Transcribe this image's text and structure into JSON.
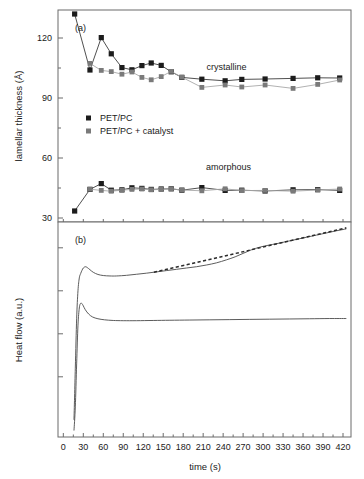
{
  "figure": {
    "background": "#ffffff",
    "panel_a_label": "(a)",
    "panel_b_label": "(b)"
  },
  "chart_data": [
    {
      "type": "scatter",
      "panel": "(a)",
      "title": "",
      "xlabel": "",
      "ylabel": "lamellar thickness (Å)",
      "xlim": [
        -8,
        432
      ],
      "ylim": [
        28,
        134
      ],
      "xticks": [
        0,
        30,
        60,
        90,
        120,
        150,
        180,
        210,
        240,
        270,
        300,
        330,
        360,
        390,
        420
      ],
      "yticks": [
        30,
        60,
        90,
        120
      ],
      "ytick_labels": [
        "30",
        "60",
        "90",
        "120"
      ],
      "minor_yticks": [
        45,
        75,
        105
      ],
      "grid": false,
      "legend_position": "center-left",
      "legend": [
        {
          "label": "PET/PC",
          "marker": "filled-square-dark",
          "color": "#1c1c1c"
        },
        {
          "label": "PET/PC + catalyst",
          "marker": "filled-square-gray",
          "color": "#7a7a7a"
        }
      ],
      "annotations": [
        {
          "text": "crystalline",
          "x": 245,
          "y": 104
        },
        {
          "text": "amorphous",
          "x": 248,
          "y": 54
        }
      ],
      "series": [
        {
          "name": "PET/PC crystalline",
          "color": "#1c1c1c",
          "marker": "square",
          "x": [
            17,
            40,
            57,
            72,
            88,
            103,
            118,
            132,
            147,
            162,
            178,
            208,
            243,
            268,
            303,
            345,
            382,
            415
          ],
          "y": [
            132,
            104,
            120.2,
            112.1,
            105.2,
            104.1,
            106.2,
            107.5,
            106.3,
            103.1,
            100.3,
            99.4,
            98.6,
            99.3,
            99.5,
            99.8,
            100.1,
            100.0
          ]
        },
        {
          "name": "PET/PC + catalyst crystalline",
          "color": "#7a7a7a",
          "marker": "square",
          "x": [
            40,
            57,
            72,
            88,
            103,
            118,
            132,
            147,
            162,
            178,
            208,
            243,
            268,
            303,
            345,
            382,
            415
          ],
          "y": [
            107.3,
            103.8,
            103.2,
            101.9,
            103.0,
            100.3,
            99.1,
            100.7,
            103.3,
            100.4,
            95.3,
            96.5,
            95.5,
            96.5,
            94.8,
            96.8,
            99.0
          ]
        },
        {
          "name": "PET/PC amorphous",
          "color": "#1c1c1c",
          "marker": "square",
          "x": [
            17,
            40,
            57,
            72,
            88,
            103,
            118,
            132,
            147,
            162,
            178,
            208,
            243,
            268,
            303,
            345,
            382,
            415
          ],
          "y": [
            33.5,
            44.3,
            47.2,
            43.9,
            44.1,
            45.1,
            44.8,
            44.3,
            44.5,
            44.6,
            43.9,
            45.2,
            43.8,
            43.9,
            43.5,
            44.1,
            44.2,
            43.8
          ]
        },
        {
          "name": "PET/PC + catalyst amorphous",
          "color": "#7a7a7a",
          "marker": "square",
          "x": [
            40,
            57,
            72,
            88,
            103,
            118,
            132,
            147,
            162,
            178,
            208,
            243,
            268,
            303,
            345,
            382,
            415
          ],
          "y": [
            44.4,
            43.8,
            43.4,
            43.9,
            44.3,
            44.5,
            44.1,
            44.3,
            44.6,
            44.0,
            43.6,
            44.6,
            43.7,
            43.8,
            43.4,
            44.0,
            44.5
          ]
        }
      ]
    },
    {
      "type": "line",
      "panel": "(b)",
      "title": "",
      "xlabel": "time (s)",
      "ylabel": "Heat flow (a.u.)",
      "xlim": [
        -8,
        432
      ],
      "ylim": [
        0,
        100
      ],
      "xticks": [
        0,
        30,
        60,
        90,
        120,
        150,
        180,
        210,
        240,
        270,
        300,
        330,
        360,
        390,
        420
      ],
      "xtick_labels": [
        "0",
        "30",
        "60",
        "90",
        "120",
        "150",
        "180",
        "210",
        "240",
        "270",
        "300",
        "330",
        "360",
        "390",
        "420"
      ],
      "yticks": [],
      "ytick_labels": [],
      "grid": false,
      "legend_position": "none",
      "series": [
        {
          "name": "PET/PC heat flow",
          "style": "solid",
          "color": "#4a4a4a",
          "x": [
            16,
            18,
            20,
            22,
            24,
            26,
            28,
            30,
            33,
            36,
            40,
            45,
            52,
            60,
            70,
            80,
            95,
            110,
            125,
            140,
            155,
            170,
            185,
            200,
            215,
            230,
            245,
            258,
            270,
            282,
            295,
            308,
            320,
            335,
            350,
            365,
            380,
            395,
            410,
            425
          ],
          "y": [
            8,
            32,
            55,
            68,
            74,
            76,
            77.5,
            78.6,
            79.2,
            78.8,
            77.8,
            76.6,
            75.6,
            75.1,
            74.9,
            74.9,
            75.2,
            75.7,
            76.2,
            76.8,
            77.4,
            78.0,
            78.6,
            79.2,
            80.0,
            81.0,
            82.4,
            83.8,
            85.4,
            87.0,
            88.3,
            89.2,
            89.9,
            90.9,
            91.9,
            92.9,
            93.9,
            94.9,
            95.9,
            96.8
          ]
        },
        {
          "name": "PET/PC + catalyst heat flow",
          "style": "solid",
          "color": "#5a5a5a",
          "x": [
            16,
            18,
            20,
            22,
            24,
            26,
            28,
            30,
            33,
            38,
            44,
            52,
            62,
            75,
            90,
            110,
            135,
            160,
            190,
            220,
            250,
            280,
            310,
            340,
            370,
            400,
            425
          ],
          "y": [
            3,
            14,
            34,
            52,
            60,
            62.2,
            62.0,
            61.0,
            59.2,
            57.2,
            55.8,
            55.0,
            54.5,
            54.2,
            54.1,
            54.1,
            54.2,
            54.3,
            54.4,
            54.5,
            54.6,
            54.7,
            54.8,
            54.9,
            55.0,
            55.1,
            55.1
          ]
        },
        {
          "name": "baseline tangent",
          "style": "dashed",
          "color": "#2b2b2b",
          "x": [
            136,
            425
          ],
          "y": [
            76.6,
            97.3
          ]
        }
      ]
    }
  ]
}
